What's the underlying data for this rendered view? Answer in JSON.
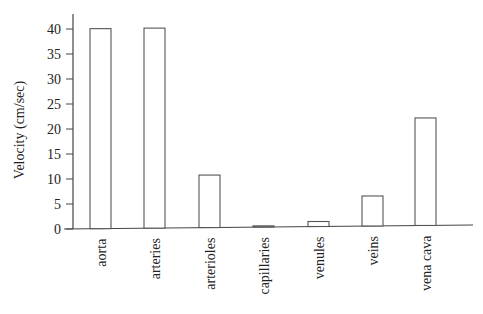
{
  "chart_data": {
    "type": "bar",
    "title": "",
    "xlabel": "",
    "ylabel": "Velocity (cm/sec)",
    "categories": [
      "aorta",
      "arteries",
      "arterioles",
      "capillaries",
      "venules",
      "veins",
      "vena cava"
    ],
    "values": [
      40,
      40,
      10.5,
      0.1,
      1,
      6,
      21.5
    ],
    "ylim": [
      0,
      42
    ],
    "yticks": [
      0,
      5,
      10,
      15,
      20,
      25,
      30,
      35,
      40
    ],
    "grid": false,
    "legend": null,
    "bar_fill": "#ffffff",
    "bar_stroke": "#555555"
  }
}
